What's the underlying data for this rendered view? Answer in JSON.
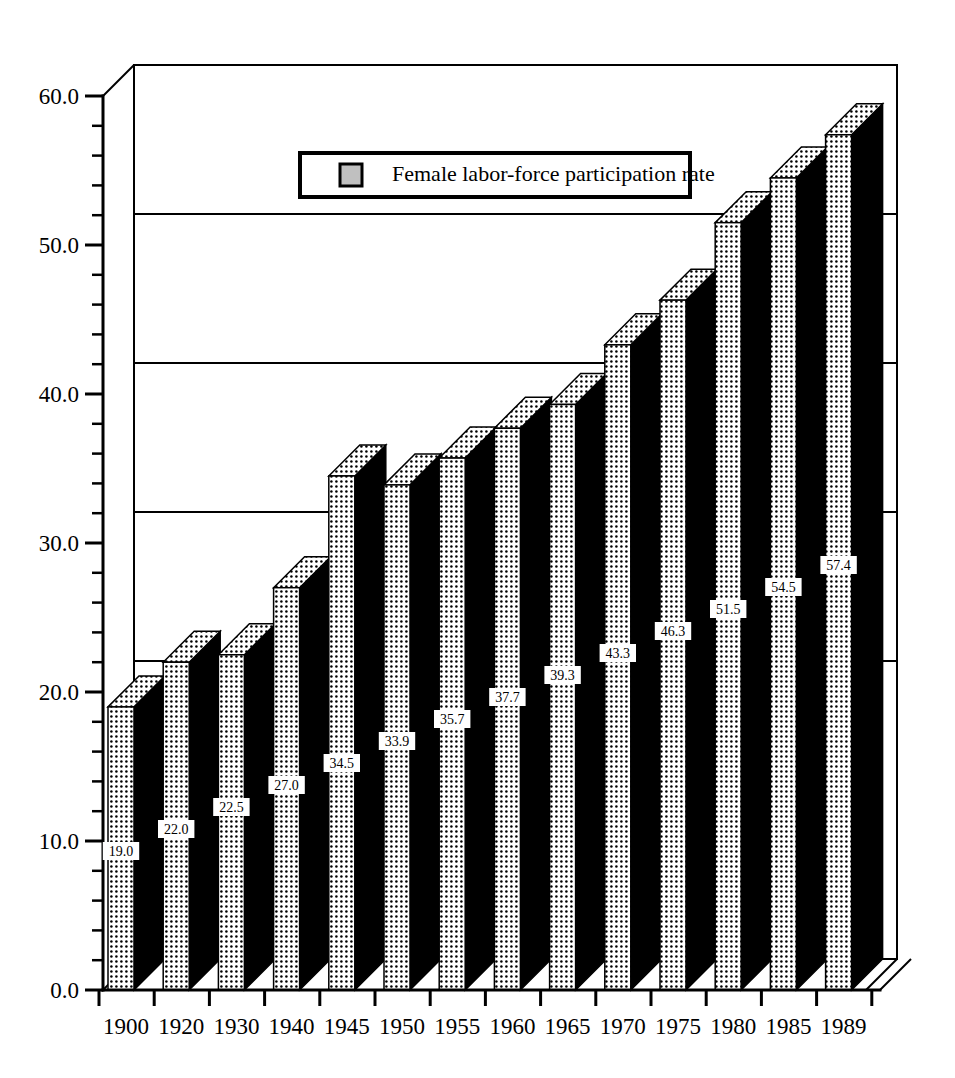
{
  "chart_data": {
    "type": "bar",
    "title": "",
    "subtitle": "",
    "xlabel": "",
    "ylabel": "",
    "categories": [
      "1900",
      "1920",
      "1930",
      "1940",
      "1945",
      "1950",
      "1955",
      "1960",
      "1965",
      "1970",
      "1975",
      "1980",
      "1985",
      "1989"
    ],
    "values": [
      19.0,
      22.0,
      22.5,
      27.0,
      34.5,
      33.9,
      35.7,
      37.7,
      39.3,
      43.3,
      46.3,
      51.5,
      54.5,
      57.4
    ],
    "value_labels": [
      "19.0",
      "22.0",
      "22.5",
      "27.0",
      "34.5",
      "33.9",
      "35.7",
      "37.7",
      "39.3",
      "43.3",
      "46.3",
      "51.5",
      "54.5",
      "57.4"
    ],
    "series": [
      {
        "name": "Female labor-force participation rate",
        "values": [
          19.0,
          22.0,
          22.5,
          27.0,
          34.5,
          33.9,
          35.7,
          37.7,
          39.3,
          43.3,
          46.3,
          51.5,
          54.5,
          57.4
        ]
      }
    ],
    "ylim": [
      0.0,
      60.0
    ],
    "ytick_labels": [
      "0.0",
      "10.0",
      "20.0",
      "30.0",
      "40.0",
      "50.0",
      "60.0"
    ],
    "ytick_values": [
      0.0,
      10.0,
      20.0,
      30.0,
      40.0,
      50.0,
      60.0
    ],
    "yminor_step": 2.0,
    "grid": true,
    "grid_axis": "y",
    "gridline_values": [
      20.0,
      30.0,
      40.0,
      50.0
    ],
    "legend": {
      "position": "top-center",
      "entries": [
        {
          "label": "Female labor-force participation rate",
          "swatch_color": "#c0c0c0",
          "pattern": "dotted"
        }
      ]
    },
    "style": {
      "three_d": true,
      "bar_front_pattern": "dotted",
      "bar_side_color": "#000000",
      "background": "#ffffff",
      "foreground": "#000000"
    }
  },
  "legend": {
    "label": "Female labor-force participation rate"
  },
  "axes": {
    "y_labels": [
      "60.0",
      "50.0",
      "40.0",
      "30.0",
      "20.0",
      "10.0",
      "0.0"
    ],
    "x_labels": [
      "1900",
      "1920",
      "1930",
      "1940",
      "1945",
      "1950",
      "1955",
      "1960",
      "1965",
      "1970",
      "1975",
      "1980",
      "1985",
      "1989"
    ]
  }
}
